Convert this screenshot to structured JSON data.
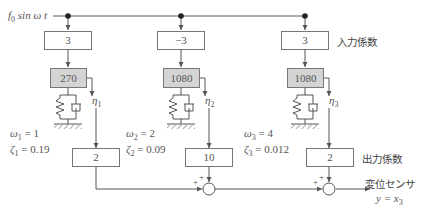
{
  "input": {
    "label_f": "f",
    "label_sub": "0",
    "label_rest": " sin ω t"
  },
  "columns": [
    {
      "input_coef": "3",
      "modal_mass": "270",
      "eta": "η",
      "eta_sub": "1",
      "omega": "ω",
      "omega_sub": "1",
      "omega_val": " = 1",
      "zeta": "ζ",
      "zeta_sub": "1",
      "zeta_val": " = 0.19",
      "output_coef": "2"
    },
    {
      "input_coef": "−3",
      "modal_mass": "1080",
      "eta": "η",
      "eta_sub": "2",
      "omega": "ω",
      "omega_sub": "2",
      "omega_val": " = 2",
      "zeta": "ζ",
      "zeta_sub": "2",
      "zeta_val": " = 0.09",
      "output_coef": "10"
    },
    {
      "input_coef": "3",
      "modal_mass": "1080",
      "eta": "η",
      "eta_sub": "3",
      "omega": "ω",
      "omega_sub": "3",
      "omega_val": " = 4",
      "zeta": "ζ",
      "zeta_sub": "3",
      "zeta_val": " = 0.012",
      "output_coef": "2"
    }
  ],
  "labels": {
    "input_coef": "入力係数",
    "output_coef": "出力係数",
    "sensor": "変位センサ",
    "output_eq_y": "y = x",
    "output_eq_sub": "3",
    "plus": "+"
  }
}
